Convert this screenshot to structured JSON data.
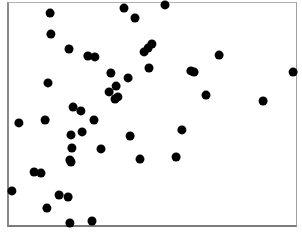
{
  "chart_data": {
    "type": "scatter",
    "title": "",
    "xlabel": "",
    "ylabel": "",
    "grid": false,
    "legend": null,
    "axis_ticks": false,
    "frame": {
      "left": 7,
      "top": 2,
      "right": 298,
      "bottom": 228
    },
    "marker": {
      "shape": "circle",
      "radius": 4.5,
      "color": "#000000"
    },
    "xlim": [
      0,
      1
    ],
    "ylim": [
      0,
      1
    ],
    "note": "Coordinates normalized to plot frame; no tick labels shown. x = (px-7)/291, y = (228-py)/226",
    "points": [
      {
        "x": 0.148,
        "y": 0.951
      },
      {
        "x": 0.402,
        "y": 0.973
      },
      {
        "x": 0.44,
        "y": 0.929
      },
      {
        "x": 0.543,
        "y": 0.987
      },
      {
        "x": 0.151,
        "y": 0.858
      },
      {
        "x": 0.213,
        "y": 0.792
      },
      {
        "x": 0.278,
        "y": 0.761
      },
      {
        "x": 0.302,
        "y": 0.757
      },
      {
        "x": 0.498,
        "y": 0.814
      },
      {
        "x": 0.485,
        "y": 0.796
      },
      {
        "x": 0.471,
        "y": 0.779
      },
      {
        "x": 0.729,
        "y": 0.765
      },
      {
        "x": 0.488,
        "y": 0.708
      },
      {
        "x": 0.632,
        "y": 0.695
      },
      {
        "x": 0.643,
        "y": 0.69
      },
      {
        "x": 0.983,
        "y": 0.69
      },
      {
        "x": 0.357,
        "y": 0.686
      },
      {
        "x": 0.416,
        "y": 0.664
      },
      {
        "x": 0.141,
        "y": 0.642
      },
      {
        "x": 0.375,
        "y": 0.628
      },
      {
        "x": 0.351,
        "y": 0.602
      },
      {
        "x": 0.381,
        "y": 0.58
      },
      {
        "x": 0.371,
        "y": 0.571
      },
      {
        "x": 0.684,
        "y": 0.588
      },
      {
        "x": 0.88,
        "y": 0.562
      },
      {
        "x": 0.227,
        "y": 0.535
      },
      {
        "x": 0.254,
        "y": 0.518
      },
      {
        "x": 0.299,
        "y": 0.478
      },
      {
        "x": 0.041,
        "y": 0.465
      },
      {
        "x": 0.131,
        "y": 0.478
      },
      {
        "x": 0.601,
        "y": 0.434
      },
      {
        "x": 0.258,
        "y": 0.425
      },
      {
        "x": 0.22,
        "y": 0.412
      },
      {
        "x": 0.423,
        "y": 0.407
      },
      {
        "x": 0.223,
        "y": 0.354
      },
      {
        "x": 0.323,
        "y": 0.35
      },
      {
        "x": 0.216,
        "y": 0.301
      },
      {
        "x": 0.22,
        "y": 0.292
      },
      {
        "x": 0.457,
        "y": 0.305
      },
      {
        "x": 0.581,
        "y": 0.314
      },
      {
        "x": 0.093,
        "y": 0.248
      },
      {
        "x": 0.117,
        "y": 0.243
      },
      {
        "x": 0.017,
        "y": 0.164
      },
      {
        "x": 0.179,
        "y": 0.146
      },
      {
        "x": 0.21,
        "y": 0.137
      },
      {
        "x": 0.137,
        "y": 0.088
      },
      {
        "x": 0.216,
        "y": 0.022
      },
      {
        "x": 0.292,
        "y": 0.031
      }
    ]
  },
  "points_px": [
    [
      50,
      13
    ],
    [
      124,
      8
    ],
    [
      135,
      18
    ],
    [
      165,
      5
    ],
    [
      51,
      34
    ],
    [
      69,
      49
    ],
    [
      88,
      56
    ],
    [
      95,
      57
    ],
    [
      152,
      44
    ],
    [
      148,
      48
    ],
    [
      144,
      52
    ],
    [
      219,
      55
    ],
    [
      149,
      68
    ],
    [
      191,
      71
    ],
    [
      194,
      72
    ],
    [
      293,
      72
    ],
    [
      111,
      73
    ],
    [
      128,
      78
    ],
    [
      48,
      83
    ],
    [
      116,
      86
    ],
    [
      109,
      92
    ],
    [
      118,
      97
    ],
    [
      115,
      99
    ],
    [
      206,
      95
    ],
    [
      263,
      101
    ],
    [
      73,
      107
    ],
    [
      81,
      111
    ],
    [
      94,
      120
    ],
    [
      19,
      123
    ],
    [
      45,
      120
    ],
    [
      182,
      130
    ],
    [
      82,
      132
    ],
    [
      71,
      135
    ],
    [
      130,
      136
    ],
    [
      72,
      148
    ],
    [
      101,
      149
    ],
    [
      70,
      160
    ],
    [
      71,
      162
    ],
    [
      140,
      159
    ],
    [
      176,
      157
    ],
    [
      34,
      172
    ],
    [
      41,
      173
    ],
    [
      12,
      191
    ],
    [
      59,
      195
    ],
    [
      68,
      197
    ],
    [
      47,
      208
    ],
    [
      70,
      223
    ],
    [
      92,
      221
    ]
  ]
}
